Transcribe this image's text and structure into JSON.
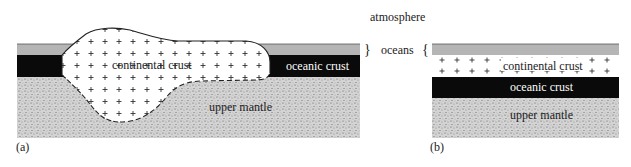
{
  "figure": {
    "labels": {
      "atmosphere": "atmosphere",
      "oceans": "oceans",
      "brace_left": "}",
      "brace_right": "{"
    },
    "panel_a": {
      "tag": "(a)",
      "continental_crust": "continental crust",
      "oceanic_crust": "oceanic crust",
      "upper_mantle": "upper mantle"
    },
    "panel_b": {
      "tag": "(b)",
      "continental_crust": "continental crust",
      "oceanic_crust": "oceanic crust",
      "upper_mantle": "upper mantle"
    },
    "colors": {
      "ocean": "#b5b5b5",
      "oceanic_crust": "#0a0a0a",
      "mantle": "#c8c8c8",
      "continent": "#ffffff",
      "text": "#222222"
    }
  }
}
